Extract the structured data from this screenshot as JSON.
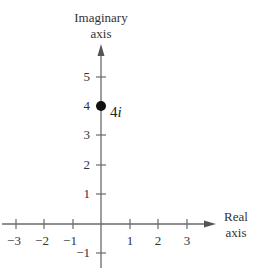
{
  "diagram": {
    "type": "complex-plane",
    "y_axis_title": [
      "Imaginary",
      "axis"
    ],
    "x_axis_title": [
      "Real",
      "axis"
    ],
    "x_ticks": [
      {
        "value": -3,
        "label": "−3"
      },
      {
        "value": -2,
        "label": "−2"
      },
      {
        "value": -1,
        "label": "−1"
      },
      {
        "value": 1,
        "label": "1"
      },
      {
        "value": 2,
        "label": "2"
      },
      {
        "value": 3,
        "label": "3"
      }
    ],
    "y_ticks": [
      {
        "value": 5,
        "label": "5"
      },
      {
        "value": 4,
        "label": "4"
      },
      {
        "value": 3,
        "label": "3"
      },
      {
        "value": 2,
        "label": "2"
      },
      {
        "value": 1,
        "label": "1"
      },
      {
        "value": -1,
        "label": "−1"
      }
    ],
    "points": [
      {
        "re": 0,
        "im": 4,
        "label_base": "4",
        "label_unit": "i"
      }
    ],
    "colors": {
      "axis": "#6a6a6a",
      "point": "#111111",
      "text": "#333333"
    }
  }
}
